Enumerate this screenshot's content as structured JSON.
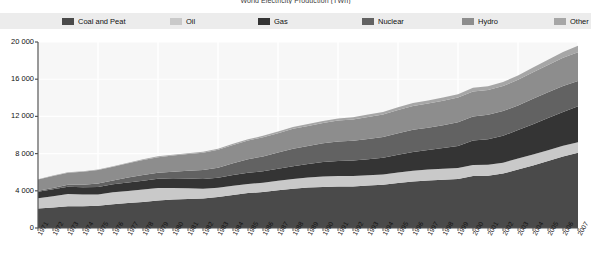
{
  "chart_title": "World Electricity Production (TWh)",
  "legend": {
    "position": "top",
    "items": [
      {
        "label": "Coal and Peat",
        "color": "#4a4a4a"
      },
      {
        "label": "Oil",
        "color": "#c9c9c9"
      },
      {
        "label": "Gas",
        "color": "#343434"
      },
      {
        "label": "Nuclear",
        "color": "#626262"
      },
      {
        "label": "Hydro",
        "color": "#8d8d8d"
      },
      {
        "label": "Other",
        "color": "#a6a6a6"
      }
    ]
  },
  "axes": {
    "y_ticks": [
      "0",
      "4 000",
      "8 000",
      "12 000",
      "16 000",
      "20 000"
    ],
    "y_min": 0,
    "y_max": 20000,
    "x_label": "",
    "y_label": ""
  },
  "chart_data": {
    "type": "area",
    "stacked": true,
    "title": "World Electricity Production (TWh)",
    "xlabel": "",
    "ylabel": "TWh",
    "ylim": [
      0,
      20000
    ],
    "grid": true,
    "legend_position": "top",
    "categories": [
      "1971",
      "1972",
      "1973",
      "1974",
      "1975",
      "1976",
      "1977",
      "1978",
      "1979",
      "1980",
      "1981",
      "1982",
      "1983",
      "1984",
      "1985",
      "1986",
      "1987",
      "1988",
      "1989",
      "1990",
      "1991",
      "1992",
      "1993",
      "1994",
      "1995",
      "1996",
      "1997",
      "1998",
      "1999",
      "2000",
      "2001",
      "2002",
      "2003",
      "2004",
      "2005",
      "2006",
      "2007"
    ],
    "series": [
      {
        "name": "Coal and Peat",
        "color": "#4a4a4a",
        "values": [
          2100,
          2210,
          2330,
          2340,
          2400,
          2560,
          2680,
          2790,
          2960,
          3060,
          3130,
          3180,
          3330,
          3560,
          3760,
          3860,
          4060,
          4230,
          4350,
          4420,
          4450,
          4470,
          4560,
          4640,
          4830,
          5010,
          5120,
          5180,
          5280,
          5580,
          5620,
          5850,
          6300,
          6720,
          7200,
          7700,
          8100
        ]
      },
      {
        "name": "Oil",
        "color": "#c9c9c9",
        "values": [
          1100,
          1200,
          1320,
          1250,
          1200,
          1280,
          1310,
          1340,
          1340,
          1250,
          1140,
          1050,
          1000,
          990,
          980,
          1010,
          1020,
          1050,
          1080,
          1120,
          1130,
          1130,
          1120,
          1120,
          1140,
          1150,
          1180,
          1190,
          1180,
          1200,
          1180,
          1160,
          1180,
          1180,
          1170,
          1150,
          1130
        ]
      },
      {
        "name": "Gas",
        "color": "#343434",
        "values": [
          690,
          750,
          790,
          800,
          820,
          860,
          900,
          940,
          990,
          1030,
          1040,
          1050,
          1070,
          1150,
          1200,
          1230,
          1300,
          1370,
          1450,
          1560,
          1620,
          1660,
          1710,
          1790,
          1900,
          2000,
          2090,
          2220,
          2370,
          2620,
          2740,
          2900,
          3060,
          3250,
          3450,
          3620,
          3850
        ]
      },
      {
        "name": "Nuclear",
        "color": "#626262",
        "values": [
          110,
          150,
          200,
          260,
          360,
          420,
          540,
          640,
          650,
          720,
          850,
          960,
          1090,
          1260,
          1450,
          1600,
          1730,
          1870,
          1940,
          2010,
          2100,
          2120,
          2180,
          2240,
          2330,
          2400,
          2390,
          2450,
          2530,
          2590,
          2640,
          2660,
          2640,
          2740,
          2770,
          2790,
          2720
        ]
      },
      {
        "name": "Hydro",
        "color": "#8d8d8d",
        "values": [
          1210,
          1280,
          1300,
          1390,
          1450,
          1460,
          1520,
          1610,
          1680,
          1730,
          1790,
          1840,
          1920,
          1970,
          2010,
          2060,
          2090,
          2150,
          2160,
          2190,
          2260,
          2290,
          2370,
          2420,
          2500,
          2560,
          2610,
          2630,
          2660,
          2700,
          2650,
          2690,
          2750,
          2860,
          2950,
          3040,
          3110
        ]
      },
      {
        "name": "Other",
        "color": "#a6a6a6",
        "values": [
          40,
          45,
          50,
          55,
          60,
          65,
          70,
          78,
          85,
          92,
          100,
          108,
          118,
          128,
          140,
          152,
          165,
          180,
          195,
          210,
          225,
          240,
          255,
          272,
          290,
          310,
          330,
          350,
          372,
          400,
          420,
          445,
          475,
          510,
          560,
          620,
          690
        ]
      }
    ]
  }
}
